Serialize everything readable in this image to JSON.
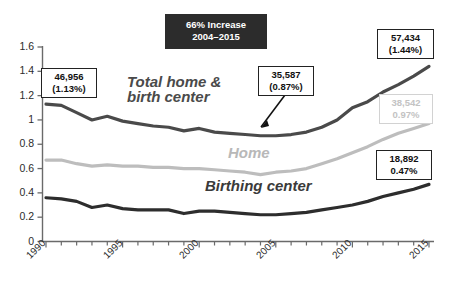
{
  "title_box": {
    "line1": "66% Increase",
    "line2": "2004–2015",
    "background": "#2c2c2c",
    "color": "#ffffff"
  },
  "series_labels": {
    "total": "Total home & birth center",
    "total_line1": "Total home &",
    "total_line2": "birth center",
    "home": "Home",
    "birth": "Birthing center"
  },
  "callouts": [
    {
      "name": "total-1990",
      "line1": "46,956",
      "line2": "(1.13%)",
      "style": "dark"
    },
    {
      "name": "total-2004",
      "line1": "35,587",
      "line2": "(0.87%)",
      "style": "dark"
    },
    {
      "name": "total-2015",
      "line1": "57,434",
      "line2": "(1.44%)",
      "style": "dark"
    },
    {
      "name": "home-2015",
      "line1": "38,542",
      "line2": "0.97%",
      "style": "muted"
    },
    {
      "name": "birth-2015",
      "line1": "18,892",
      "line2": "0.47%",
      "style": "dark"
    }
  ],
  "chart_data": {
    "type": "line",
    "title": "66% Increase 2004–2015",
    "xlabel": "",
    "ylabel": "",
    "xlim": [
      1990,
      2015
    ],
    "ylim": [
      0,
      1.6
    ],
    "ytick_labels": [
      "0",
      "0.2",
      "0.4",
      "0.6",
      "0.8",
      "1",
      "1.2",
      "1.4",
      "1.6"
    ],
    "ytick_values": [
      0,
      0.2,
      0.4,
      0.6,
      0.8,
      1,
      1.2,
      1.4,
      1.6
    ],
    "xtick_labels": [
      "1990",
      "1995",
      "2000",
      "2005",
      "2010",
      "2015"
    ],
    "xtick_values": [
      1990,
      1995,
      2000,
      2005,
      2010,
      2015
    ],
    "minor_xticks_every": 1,
    "grid": false,
    "legend": "inline-labels",
    "x": [
      1990,
      1991,
      1992,
      1993,
      1994,
      1995,
      1996,
      1997,
      1998,
      1999,
      2000,
      2001,
      2002,
      2003,
      2004,
      2005,
      2006,
      2007,
      2008,
      2009,
      2010,
      2011,
      2012,
      2013,
      2014,
      2015
    ],
    "series": [
      {
        "name": "Total home & birth center",
        "color": "#4a4a4a",
        "values": [
          1.13,
          1.12,
          1.06,
          1.0,
          1.03,
          0.99,
          0.97,
          0.95,
          0.94,
          0.91,
          0.93,
          0.9,
          0.89,
          0.88,
          0.87,
          0.87,
          0.88,
          0.9,
          0.94,
          1.0,
          1.1,
          1.15,
          1.23,
          1.29,
          1.36,
          1.44
        ],
        "annotations": [
          {
            "x": 1990,
            "label": "46,956 (1.13%)"
          },
          {
            "x": 2004,
            "label": "35,587 (0.87%)"
          },
          {
            "x": 2015,
            "label": "57,434 (1.44%)"
          }
        ]
      },
      {
        "name": "Home",
        "color": "#bdbdbd",
        "values": [
          0.67,
          0.67,
          0.64,
          0.62,
          0.63,
          0.62,
          0.62,
          0.61,
          0.61,
          0.6,
          0.6,
          0.59,
          0.58,
          0.57,
          0.55,
          0.57,
          0.58,
          0.6,
          0.64,
          0.68,
          0.73,
          0.78,
          0.84,
          0.89,
          0.93,
          0.97
        ],
        "annotations": [
          {
            "x": 2015,
            "label": "38,542 0.97%"
          }
        ]
      },
      {
        "name": "Birthing center",
        "color": "#2d2d2d",
        "values": [
          0.36,
          0.35,
          0.33,
          0.28,
          0.3,
          0.27,
          0.26,
          0.26,
          0.26,
          0.23,
          0.25,
          0.25,
          0.24,
          0.23,
          0.22,
          0.22,
          0.23,
          0.24,
          0.26,
          0.28,
          0.3,
          0.33,
          0.37,
          0.4,
          0.43,
          0.47
        ],
        "annotations": [
          {
            "x": 2015,
            "label": "18,892 0.47%"
          }
        ]
      }
    ]
  },
  "axis": {
    "y_labels": [
      "1.6",
      "1.4",
      "1.2",
      "1",
      "0.8",
      "0.6",
      "0.4",
      "0.2",
      "0"
    ],
    "x_labels": [
      "1990",
      "1995",
      "2000",
      "2005",
      "2010",
      "2015"
    ]
  }
}
